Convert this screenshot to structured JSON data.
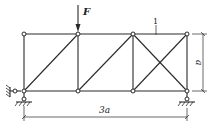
{
  "diagram": {
    "type": "truss",
    "load": {
      "label": "F",
      "at_node": "T2",
      "direction": "down"
    },
    "member_label": {
      "text": "1",
      "member": "T3-T4"
    },
    "dimension_width": {
      "label": "3a"
    },
    "dimension_height": {
      "label": "a"
    },
    "nodes": {
      "T1": [
        24,
        34
      ],
      "T2": [
        78,
        34
      ],
      "T3": [
        133,
        34
      ],
      "T4": [
        187,
        34
      ],
      "B1": [
        24,
        91
      ],
      "B2": [
        78,
        91
      ],
      "B3": [
        133,
        91
      ],
      "B4": [
        187,
        91
      ]
    },
    "members": [
      [
        "T1",
        "T2"
      ],
      [
        "T2",
        "T3"
      ],
      [
        "T3",
        "T4"
      ],
      [
        "B1",
        "B2"
      ],
      [
        "B2",
        "B3"
      ],
      [
        "B3",
        "B4"
      ],
      [
        "T1",
        "B1"
      ],
      [
        "T2",
        "B2"
      ],
      [
        "T3",
        "B3"
      ],
      [
        "T4",
        "B4"
      ],
      [
        "B1",
        "T2"
      ],
      [
        "B2",
        "T3"
      ],
      [
        "T3",
        "B4"
      ],
      [
        "B3",
        "T4"
      ]
    ],
    "supports": [
      {
        "node": "B1",
        "type": "fixed-pin"
      },
      {
        "node": "B4",
        "type": "roller"
      }
    ],
    "colors": {
      "line": "#2a2a2a",
      "background": "#ffffff"
    }
  }
}
